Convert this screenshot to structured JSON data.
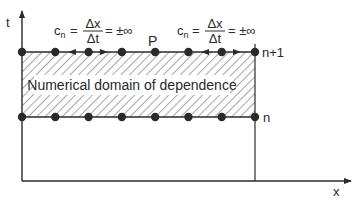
{
  "figure": {
    "axes": {
      "t_label": "t",
      "x_label": "x"
    },
    "levels": {
      "upper": "n+1",
      "lower": "n"
    },
    "point_label": "P",
    "region_label": "Numerical domain of dependence",
    "equation_left": {
      "lhs": "c",
      "lhs_sub": "n",
      "eq": "=",
      "num": "Δx",
      "den": "Δt",
      "rhs": "= ±∞"
    },
    "equation_right": {
      "lhs": "c",
      "lhs_sub": "n",
      "eq": "=",
      "num": "Δx",
      "den": "Δt",
      "rhs": "= ±∞"
    },
    "grid_points_per_level": 8,
    "colors": {
      "ink": "#2a2a2a",
      "background": "#ffffff"
    }
  }
}
